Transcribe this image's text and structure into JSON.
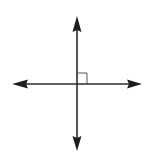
{
  "diagram": {
    "type": "perpendicular-lines",
    "colors": {
      "background": "#ffffff",
      "line": "#2a2a2a",
      "marker": "#555555"
    },
    "intersection": {
      "x": 77,
      "y": 84
    },
    "vertical_line": {
      "x": 77,
      "y_top": 16,
      "y_bottom": 150
    },
    "horizontal_line": {
      "y": 84,
      "x_left": 13,
      "x_right": 141
    },
    "right_angle_marker": {
      "x": 77,
      "y": 73,
      "size": 10,
      "quadrant": "upper-right"
    }
  }
}
